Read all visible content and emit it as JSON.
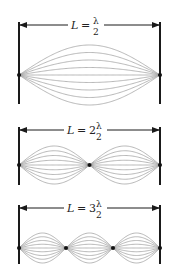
{
  "figure": {
    "colors": {
      "wall": "#1a1a1a",
      "wave": "#9a9a9a",
      "node": "#111111",
      "background": "#ffffff"
    },
    "panels": [
      {
        "id": "harmonic-1",
        "label": {
          "var": "L",
          "eq": "=",
          "coef": "",
          "num": "λ",
          "den": "2"
        },
        "loops": 1,
        "wall_top": 22,
        "arrow_y": 25,
        "node_y": 75,
        "wall_bottom": 104,
        "amplitude": 30
      },
      {
        "id": "harmonic-2",
        "label": {
          "var": "L",
          "eq": "=",
          "coef": "2",
          "num": "λ",
          "den": "2"
        },
        "loops": 2,
        "wall_top": 127,
        "arrow_y": 130,
        "node_y": 165,
        "wall_bottom": 185,
        "amplitude": 19
      },
      {
        "id": "harmonic-3",
        "label": {
          "var": "L",
          "eq": "=",
          "coef": "3",
          "num": "λ",
          "den": "2"
        },
        "loops": 3,
        "wall_top": 205,
        "arrow_y": 208,
        "node_y": 248,
        "wall_bottom": 264,
        "amplitude": 15
      }
    ],
    "left_x": 19,
    "right_x": 160,
    "amplitude_fractions": [
      1,
      0.75,
      0.5,
      0.25,
      0,
      -0.25,
      -0.5,
      -0.75,
      -1
    ]
  }
}
